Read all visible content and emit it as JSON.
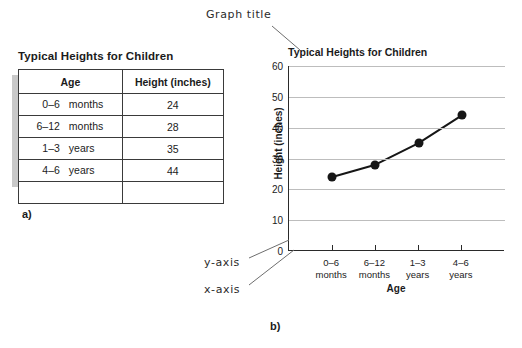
{
  "figure": {
    "panel_a_label": "a)",
    "panel_b_label": "b)"
  },
  "table_panel": {
    "caption": "Typical Heights for Children",
    "columns": [
      "Age",
      "Height (inches)"
    ],
    "rows": [
      {
        "age_num": "0–6",
        "age_unit": "months",
        "height": "24"
      },
      {
        "age_num": "6–12",
        "age_unit": "months",
        "height": "28"
      },
      {
        "age_num": "1–3",
        "age_unit": "years",
        "height": "35"
      },
      {
        "age_num": "4–6",
        "age_unit": "years",
        "height": "44"
      }
    ]
  },
  "annotations": {
    "graph_title": "Graph title",
    "y_axis": "y-axis",
    "x_axis": "x-axis"
  },
  "chart_data": {
    "type": "line",
    "title": "Typical Heights for Children",
    "xlabel": "Age",
    "ylabel": "Height (inches)",
    "categories": [
      "0–6 months",
      "6–12 months",
      "1–3 years",
      "4–6 years"
    ],
    "category_lines": [
      [
        "0–6",
        "months"
      ],
      [
        "6–12",
        "months"
      ],
      [
        "1–3",
        "years"
      ],
      [
        "4–6",
        "years"
      ]
    ],
    "values": [
      24,
      28,
      35,
      44
    ],
    "ylim": [
      0,
      60
    ],
    "yticks": [
      0,
      10,
      20,
      30,
      40,
      50,
      60
    ],
    "grid": true,
    "legend": false,
    "marker": "filled-circle",
    "line_color": "#161616",
    "grid_color": "#bdbdbd",
    "axis_color": "#2a2a2a"
  }
}
